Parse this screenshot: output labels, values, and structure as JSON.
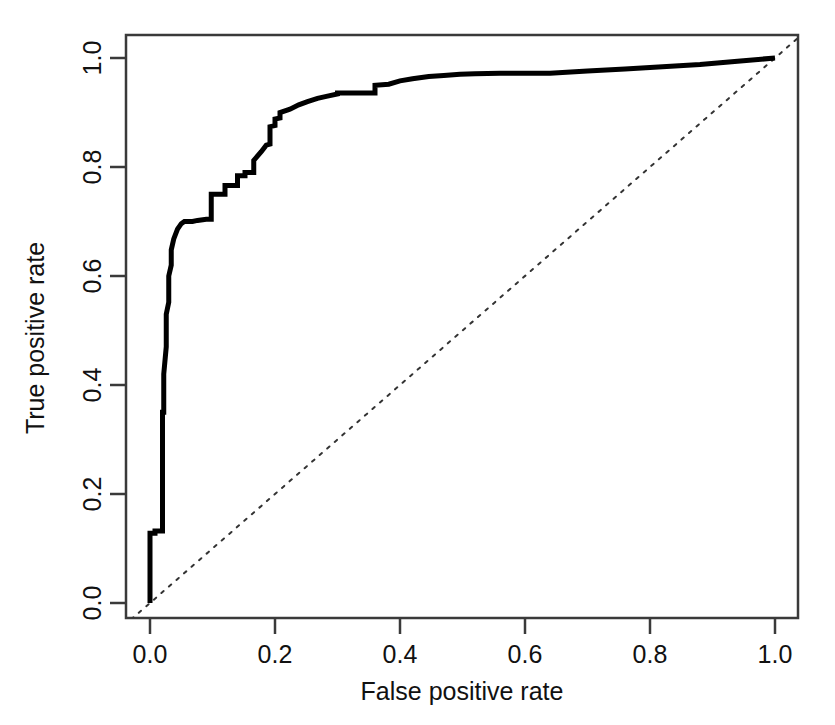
{
  "chart_data": {
    "type": "line",
    "title": "",
    "subtitle": "",
    "xlabel": "False positive rate",
    "ylabel": "True positive rate",
    "xlim": [
      0.0,
      1.0
    ],
    "ylim": [
      0.0,
      1.0
    ],
    "grid": false,
    "legend": null,
    "xticks": [
      "0.0",
      "0.2",
      "0.4",
      "0.6",
      "0.8",
      "1.0"
    ],
    "xtick_values": [
      0.0,
      0.2,
      0.4,
      0.6,
      0.8,
      1.0
    ],
    "yticks": [
      "0.0",
      "0.2",
      "0.4",
      "0.6",
      "0.8",
      "1.0"
    ],
    "ytick_values": [
      0.0,
      0.2,
      0.4,
      0.6,
      0.8,
      1.0
    ],
    "series": [
      {
        "name": "ROC curve",
        "style": "solid",
        "color": "#000000",
        "width": 5,
        "x": [
          0.0,
          0.0,
          0.008,
          0.008,
          0.02,
          0.02,
          0.022,
          0.022,
          0.026,
          0.026,
          0.03,
          0.03,
          0.034,
          0.034,
          0.038,
          0.044,
          0.05,
          0.055,
          0.06,
          0.068,
          0.076,
          0.09,
          0.098,
          0.098,
          0.12,
          0.12,
          0.14,
          0.14,
          0.152,
          0.152,
          0.166,
          0.166,
          0.178,
          0.186,
          0.192,
          0.192,
          0.2,
          0.2,
          0.208,
          0.208,
          0.224,
          0.238,
          0.252,
          0.268,
          0.284,
          0.3,
          0.3,
          0.36,
          0.36,
          0.382,
          0.4,
          0.42,
          0.446,
          0.47,
          0.496,
          0.52,
          0.56,
          0.6,
          0.64,
          0.7,
          0.76,
          0.82,
          0.88,
          0.94,
          1.0
        ],
        "y": [
          0.0,
          0.128,
          0.128,
          0.132,
          0.132,
          0.35,
          0.35,
          0.42,
          0.47,
          0.53,
          0.552,
          0.6,
          0.62,
          0.648,
          0.668,
          0.686,
          0.696,
          0.7,
          0.7,
          0.7,
          0.702,
          0.704,
          0.704,
          0.75,
          0.75,
          0.766,
          0.766,
          0.784,
          0.784,
          0.79,
          0.79,
          0.812,
          0.828,
          0.84,
          0.842,
          0.874,
          0.876,
          0.888,
          0.89,
          0.9,
          0.906,
          0.914,
          0.92,
          0.926,
          0.93,
          0.934,
          0.936,
          0.936,
          0.95,
          0.952,
          0.958,
          0.962,
          0.966,
          0.968,
          0.97,
          0.971,
          0.972,
          0.972,
          0.972,
          0.976,
          0.98,
          0.984,
          0.988,
          0.994,
          1.0
        ]
      },
      {
        "name": "chance diagonal",
        "style": "dotted",
        "color": "#333333",
        "width": 2,
        "x": [
          -0.03,
          1.04
        ],
        "y": [
          -0.03,
          1.04
        ]
      }
    ]
  },
  "axes": {
    "x_title": "False positive rate",
    "y_title": "True positive rate"
  }
}
